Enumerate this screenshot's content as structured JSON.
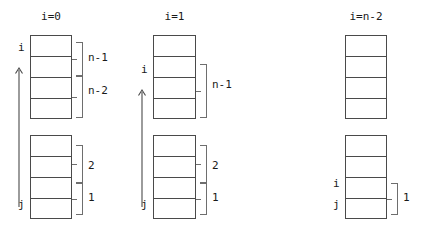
{
  "figure": {
    "background_color": "#ffffff",
    "line_color": "#4a4a4a",
    "brace_color": "#6e6e6e",
    "text_color": "#1a1a1a"
  },
  "columns": [
    {
      "title": "i=0",
      "pointers": [
        {
          "name": "i",
          "label": "i"
        },
        {
          "name": "j",
          "label": "j"
        }
      ],
      "arrow": {
        "direction": "up",
        "from": "j",
        "to": "i"
      },
      "braces": [
        {
          "label": "n-1"
        },
        {
          "label": "n-2"
        },
        {
          "label": "2"
        },
        {
          "label": "1"
        }
      ]
    },
    {
      "title": "i=1",
      "pointers": [
        {
          "name": "i",
          "label": "i"
        },
        {
          "name": "j",
          "label": "j"
        }
      ],
      "arrow": {
        "direction": "up",
        "from": "j",
        "to": "i"
      },
      "braces": [
        {
          "label": "n-1"
        },
        {
          "label": "2"
        },
        {
          "label": "1"
        }
      ]
    },
    {
      "title": "i=n-2",
      "pointers": [
        {
          "name": "i",
          "label": "i"
        },
        {
          "name": "j",
          "label": "j"
        }
      ],
      "arrow": null,
      "braces": [
        {
          "label": "1"
        }
      ]
    }
  ]
}
